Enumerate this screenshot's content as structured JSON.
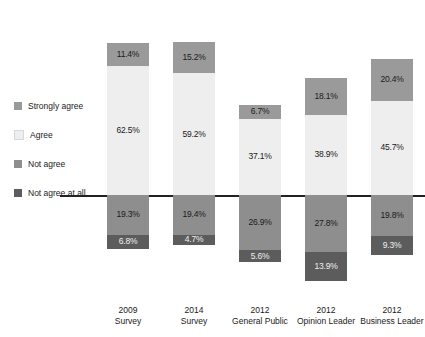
{
  "legend": {
    "items": [
      {
        "label": "Strongly agree",
        "color": "#9a9a9a",
        "key": "strongly_agree"
      },
      {
        "label": "Agree",
        "color": "#eeeeee",
        "key": "agree"
      },
      {
        "label": "Not agree",
        "color": "#8e8e8e",
        "key": "not_agree"
      },
      {
        "label": "Not agree at all",
        "color": "#5c5c5c",
        "key": "not_agree_at_all"
      }
    ]
  },
  "chart_data": {
    "type": "bar",
    "subtype": "diverging-stacked-bar",
    "title": "",
    "xlabel": "",
    "ylabel": "",
    "grid": false,
    "legend_position": "left",
    "stack_order_top_to_bottom": [
      "Strongly agree",
      "Agree",
      "Not agree",
      "Not agree at all"
    ],
    "divider_between": [
      "Agree",
      "Not agree"
    ],
    "value_suffix": "%",
    "categories": [
      "2009\nSurvey",
      "2014\nSurvey",
      "2012\nGeneral Public",
      "2012\nOpinion Leader",
      "2012\nBusiness Leader"
    ],
    "category_lines": [
      [
        "2009",
        "Survey"
      ],
      [
        "2014",
        "Survey"
      ],
      [
        "2012",
        "General Public"
      ],
      [
        "2012",
        "Opinion Leader"
      ],
      [
        "2012",
        "Business Leader"
      ]
    ],
    "series": [
      {
        "name": "Strongly agree",
        "color": "#9a9a9a",
        "values": [
          11.4,
          15.2,
          6.7,
          18.1,
          20.4
        ]
      },
      {
        "name": "Agree",
        "color": "#eeeeee",
        "values": [
          62.5,
          59.2,
          37.1,
          38.9,
          45.7
        ]
      },
      {
        "name": "Not agree",
        "color": "#8e8e8e",
        "values": [
          19.3,
          19.4,
          26.9,
          27.8,
          19.8
        ]
      },
      {
        "name": "Not agree at all",
        "color": "#5c5c5c",
        "values": [
          6.8,
          4.7,
          5.6,
          13.9,
          9.3
        ]
      }
    ],
    "labels": {
      "strongly_agree": [
        "11.4%",
        "15.2%",
        "6.7%",
        "18.1%",
        "20.4%"
      ],
      "agree": [
        "62.5%",
        "59.2%",
        "37.1%",
        "38.9%",
        "45.7%"
      ],
      "not_agree": [
        "19.3%",
        "19.4%",
        "26.9%",
        "27.8%",
        "19.8%"
      ],
      "not_agree_at_all": [
        "6.8%",
        "4.7%",
        "5.6%",
        "13.9%",
        "9.3%"
      ]
    }
  }
}
